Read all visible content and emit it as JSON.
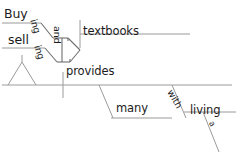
{
  "diagram": {
    "type": "reed-kellogg-sentence-diagram",
    "ink_color": "#1b1b1b",
    "line_color": "#9a9a9a",
    "background_color": "#ffffff",
    "words": {
      "buy": "Buy",
      "sell": "sell",
      "ing_buy": "ing",
      "ing_sell": "ing",
      "and": "and",
      "textbooks": "textbooks",
      "provides": "provides",
      "many": "many",
      "with": "with",
      "living": "living",
      "article_a": "a"
    }
  }
}
